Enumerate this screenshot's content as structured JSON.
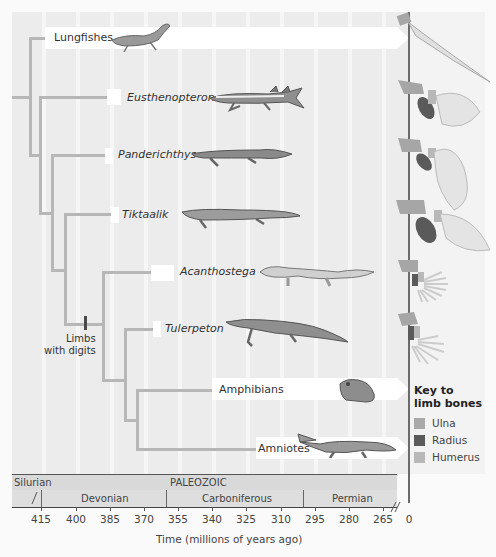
{
  "taxa": [
    {
      "name": "Lungfishes",
      "italic": false
    },
    {
      "name": "Eusthenopteron",
      "italic": true
    },
    {
      "name": "Panderichthys",
      "italic": true
    },
    {
      "name": "Tiktaalik",
      "italic": true
    },
    {
      "name": "Acanthostega",
      "italic": true
    },
    {
      "name": "Tulerpeton",
      "italic": true
    },
    {
      "name": "Amphibians",
      "italic": false
    },
    {
      "name": "Amniotes",
      "italic": false
    }
  ],
  "annotation": {
    "line1": "Limbs",
    "line2": "with digits"
  },
  "key": {
    "title_line1": "Key to",
    "title_line2": "limb bones",
    "items": [
      {
        "label": "Ulna",
        "color": "#a9a9a9"
      },
      {
        "label": "Radius",
        "color": "#5a5a5a"
      },
      {
        "label": "Humerus",
        "color": "#b8b8b8"
      }
    ]
  },
  "timescale": {
    "era": "PALEOZOIC",
    "silurian": "Silurian",
    "periods": [
      "Devonian",
      "Carboniferous",
      "Permian"
    ],
    "ticks": [
      "415",
      "400",
      "385",
      "370",
      "355",
      "340",
      "325",
      "310",
      "295",
      "280",
      "265",
      "0"
    ],
    "xlabel": "Time (millions of years ago)"
  },
  "colors": {
    "branch": "#b7b7b7",
    "background": "#ececec",
    "axis": "#6b6b6b"
  }
}
